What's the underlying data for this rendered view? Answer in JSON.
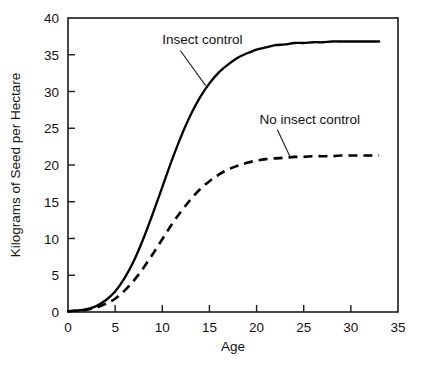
{
  "chart_data": {
    "type": "line",
    "title": "",
    "subtitle": "",
    "xlabel": "Age",
    "ylabel": "Kilograms of Seed per Hectare",
    "xlim": [
      0,
      35
    ],
    "ylim": [
      0,
      40
    ],
    "xticks": [
      "0",
      "5",
      "10",
      "15",
      "20",
      "25",
      "30",
      "35"
    ],
    "yticks": [
      "0",
      "5",
      "10",
      "15",
      "20",
      "25",
      "30",
      "35",
      "40"
    ],
    "xtick_values": [
      0,
      5,
      10,
      15,
      20,
      25,
      30,
      35
    ],
    "ytick_values": [
      0,
      5,
      10,
      15,
      20,
      25,
      30,
      35,
      40
    ],
    "grid": false,
    "legend_position": "inline-annotation",
    "frame": "box",
    "x": [
      0,
      1,
      2,
      3,
      4,
      5,
      6,
      7,
      8,
      9,
      10,
      11,
      12,
      13,
      14,
      15,
      16,
      17,
      18,
      19,
      20,
      21,
      22,
      23,
      24,
      25,
      26,
      27,
      28,
      29,
      30,
      31,
      32,
      33
    ],
    "series": [
      {
        "name": "Insect control",
        "style": "solid",
        "color": "#000000",
        "plateau": 36.8,
        "values": [
          0.1,
          0.2,
          0.4,
          0.8,
          1.6,
          2.8,
          4.6,
          7.0,
          10.0,
          13.4,
          17.0,
          20.6,
          23.9,
          26.8,
          29.2,
          31.1,
          32.6,
          33.7,
          34.6,
          35.2,
          35.7,
          36.0,
          36.3,
          36.4,
          36.6,
          36.6,
          36.7,
          36.7,
          36.8,
          36.8,
          36.8,
          36.8,
          36.8,
          36.8
        ]
      },
      {
        "name": "No insect control",
        "style": "dashed",
        "color": "#000000",
        "plateau": 21.3,
        "values": [
          0.1,
          0.2,
          0.3,
          0.6,
          1.1,
          1.8,
          2.9,
          4.3,
          6.0,
          7.9,
          9.9,
          11.9,
          13.7,
          15.3,
          16.7,
          17.8,
          18.7,
          19.4,
          19.9,
          20.3,
          20.6,
          20.8,
          20.9,
          21.0,
          21.1,
          21.1,
          21.2,
          21.2,
          21.2,
          21.3,
          21.3,
          21.3,
          21.3,
          21.3
        ]
      }
    ],
    "annotations": [
      {
        "text": "Insect control",
        "text_x": 10.0,
        "text_y": 36.4,
        "point_x": 14.6,
        "point_y": 30.8
      },
      {
        "text": "No insect control",
        "text_x": 20.3,
        "text_y": 25.6,
        "point_x": 23.6,
        "point_y": 21.0
      }
    ]
  }
}
